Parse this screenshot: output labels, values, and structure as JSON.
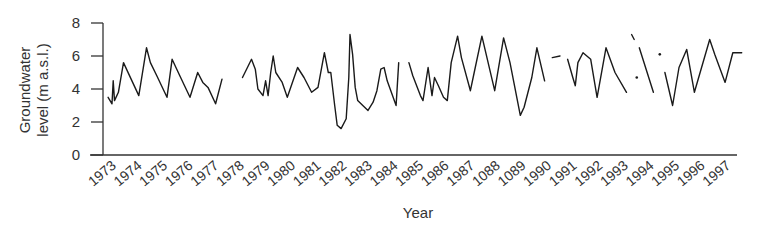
{
  "chart_data": {
    "type": "line",
    "title": "",
    "xlabel": "Year",
    "ylabel_lines": [
      "Groundwater",
      "level (m a.s.l.)"
    ],
    "ylabel": "Groundwater level (m a.s.l.)",
    "ylim": [
      0,
      8
    ],
    "yticks": [
      0,
      2,
      4,
      6,
      8
    ],
    "xlim": [
      1972.5,
      1998.2
    ],
    "xtick_labels": [
      "1973",
      "1974",
      "1975",
      "1976",
      "1977",
      "1978",
      "1979",
      "1980",
      "1981",
      "1982",
      "1983",
      "1984",
      "1985",
      "1986",
      "1987",
      "1088",
      "1089",
      "1990",
      "1991",
      "1992",
      "1993",
      "1994",
      "1995",
      "1996",
      "1997"
    ],
    "grid": false,
    "legend": null,
    "line_color": "#1a1a1a",
    "series": [
      {
        "name": "Groundwater level",
        "segments": [
          [
            [
              1973.2,
              3.5
            ],
            [
              1973.35,
              3.1
            ],
            [
              1973.4,
              4.5
            ],
            [
              1973.45,
              3.3
            ],
            [
              1973.6,
              3.8
            ],
            [
              1973.8,
              5.6
            ],
            [
              1973.95,
              5.1
            ],
            [
              1974.4,
              3.6
            ],
            [
              1974.7,
              6.5
            ],
            [
              1974.85,
              5.6
            ],
            [
              1975.1,
              4.8
            ],
            [
              1975.5,
              3.5
            ],
            [
              1975.7,
              5.8
            ],
            [
              1976.0,
              4.8
            ],
            [
              1976.4,
              3.5
            ],
            [
              1976.7,
              5.0
            ],
            [
              1976.9,
              4.4
            ],
            [
              1977.1,
              4.1
            ],
            [
              1977.4,
              3.1
            ],
            [
              1977.65,
              4.6
            ]
          ],
          [
            [
              1978.45,
              4.7
            ],
            [
              1978.8,
              5.8
            ],
            [
              1978.95,
              5.2
            ],
            [
              1979.05,
              4.0
            ],
            [
              1979.25,
              3.6
            ],
            [
              1979.35,
              4.5
            ],
            [
              1979.45,
              3.6
            ],
            [
              1979.55,
              5.0
            ],
            [
              1979.65,
              6.0
            ],
            [
              1979.75,
              5.0
            ],
            [
              1980.0,
              4.4
            ],
            [
              1980.2,
              3.5
            ],
            [
              1980.6,
              5.3
            ],
            [
              1980.85,
              4.7
            ],
            [
              1981.15,
              3.8
            ],
            [
              1981.4,
              4.1
            ],
            [
              1981.65,
              6.2
            ],
            [
              1981.8,
              5.0
            ],
            [
              1981.9,
              5.0
            ],
            [
              1982.05,
              3.0
            ],
            [
              1982.15,
              1.8
            ],
            [
              1982.3,
              1.6
            ],
            [
              1982.5,
              2.2
            ],
            [
              1982.6,
              4.7
            ],
            [
              1982.65,
              7.3
            ],
            [
              1982.75,
              6.1
            ],
            [
              1982.85,
              4.1
            ],
            [
              1982.95,
              3.3
            ],
            [
              1983.15,
              3.0
            ],
            [
              1983.35,
              2.7
            ],
            [
              1983.55,
              3.2
            ],
            [
              1983.7,
              3.9
            ],
            [
              1983.85,
              5.2
            ],
            [
              1983.98,
              5.3
            ],
            [
              1984.1,
              4.5
            ],
            [
              1984.45,
              3.0
            ],
            [
              1984.55,
              5.6
            ]
          ],
          [
            [
              1984.95,
              5.6
            ],
            [
              1985.1,
              4.8
            ],
            [
              1985.4,
              3.6
            ],
            [
              1985.5,
              3.3
            ],
            [
              1985.7,
              5.3
            ],
            [
              1985.85,
              3.6
            ],
            [
              1985.95,
              4.7
            ],
            [
              1986.1,
              4.2
            ],
            [
              1986.3,
              3.5
            ],
            [
              1986.45,
              3.3
            ],
            [
              1986.6,
              5.6
            ],
            [
              1986.85,
              7.2
            ],
            [
              1987.0,
              5.9
            ],
            [
              1987.35,
              3.9
            ],
            [
              1987.5,
              5.0
            ],
            [
              1987.8,
              7.2
            ],
            [
              1988.3,
              3.9
            ],
            [
              1988.65,
              7.1
            ],
            [
              1988.9,
              5.6
            ],
            [
              1989.3,
              2.4
            ],
            [
              1989.45,
              2.9
            ],
            [
              1989.75,
              4.7
            ],
            [
              1989.95,
              6.5
            ],
            [
              1990.25,
              4.5
            ]
          ],
          [
            [
              1990.55,
              5.9
            ],
            [
              1990.85,
              6.0
            ]
          ],
          [
            [
              1991.15,
              5.8
            ],
            [
              1991.35,
              4.7
            ],
            [
              1991.45,
              4.2
            ],
            [
              1991.55,
              5.6
            ],
            [
              1991.75,
              6.2
            ],
            [
              1992.05,
              5.8
            ],
            [
              1992.3,
              3.5
            ],
            [
              1992.65,
              6.5
            ],
            [
              1993.0,
              5.0
            ],
            [
              1993.45,
              3.8
            ]
          ],
          [
            [
              1993.65,
              7.3
            ],
            [
              1993.75,
              7.0
            ]
          ],
          [
            [
              1993.85,
              4.7
            ]
          ],
          [
            [
              1993.95,
              6.5
            ],
            [
              1994.5,
              3.8
            ]
          ],
          [
            [
              1994.75,
              6.1
            ]
          ],
          [
            [
              1994.95,
              5.0
            ],
            [
              1995.25,
              3.0
            ],
            [
              1995.5,
              5.3
            ],
            [
              1995.8,
              6.4
            ],
            [
              1996.1,
              3.8
            ],
            [
              1996.7,
              7.0
            ],
            [
              1996.9,
              6.1
            ],
            [
              1997.3,
              4.4
            ],
            [
              1997.6,
              6.2
            ],
            [
              1997.95,
              6.2
            ]
          ]
        ]
      }
    ]
  }
}
